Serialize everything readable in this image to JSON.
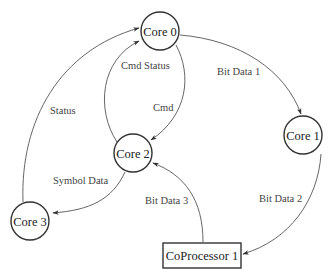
{
  "diagram": {
    "type": "directed-graph",
    "colors": {
      "stroke": "#333333",
      "edge": "#555555",
      "text": "#222222",
      "background": "#ffffff"
    },
    "nodes": [
      {
        "id": "core0",
        "label": "Core 0",
        "shape": "circle",
        "cx": 160,
        "cy": 31,
        "r": 19
      },
      {
        "id": "core1",
        "label": "Core 1",
        "shape": "circle",
        "cx": 303,
        "cy": 135,
        "r": 19
      },
      {
        "id": "core2",
        "label": "Core 2",
        "shape": "circle",
        "cx": 133,
        "cy": 153,
        "r": 19
      },
      {
        "id": "core3",
        "label": "Core 3",
        "shape": "circle",
        "cx": 30,
        "cy": 221,
        "r": 19
      },
      {
        "id": "coproc1",
        "label": "CoProcessor 1",
        "shape": "rect",
        "x": 163,
        "y": 243,
        "w": 78,
        "h": 25
      }
    ],
    "edges": [
      {
        "id": "e-bitdata1",
        "from": "core0",
        "to": "core1",
        "label": "Bit Data 1"
      },
      {
        "id": "e-bitdata2",
        "from": "core1",
        "to": "coproc1",
        "label": "Bit Data 2"
      },
      {
        "id": "e-bitdata3",
        "from": "coproc1",
        "to": "core2",
        "label": "Bit Data 3"
      },
      {
        "id": "e-cmd",
        "from": "core0",
        "to": "core2",
        "label": "Cmd"
      },
      {
        "id": "e-cmdstatus",
        "from": "core2",
        "to": "core0",
        "label": "Cmd Status"
      },
      {
        "id": "e-symboldata",
        "from": "core2",
        "to": "core3",
        "label": "Symbol Data"
      },
      {
        "id": "e-status",
        "from": "core3",
        "to": "core0",
        "label": "Status"
      }
    ]
  }
}
